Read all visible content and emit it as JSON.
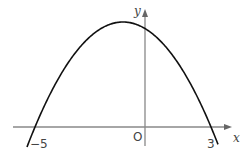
{
  "chart_data": {
    "type": "line",
    "title": "",
    "xlabel": "x",
    "ylabel": "y",
    "origin_label": "O",
    "tick_labels": [
      "−5",
      "3"
    ],
    "function": "y = -(x+5)(x-3) (downward parabola)",
    "roots": [
      -5,
      3
    ],
    "vertex_x": -1,
    "grid": false,
    "series": [
      {
        "name": "parabola",
        "x": [
          -5.4,
          -5,
          -3,
          -1,
          0,
          1,
          3,
          3.3
        ],
        "shape": "downward parabola through (-5,0) and (3,0)"
      }
    ],
    "colors": {
      "curve": "#111111",
      "axes": "#888888"
    }
  },
  "labels": {
    "x_axis": "x",
    "y_axis": "y",
    "origin": "O",
    "root_left": "−5",
    "root_right": "3"
  }
}
